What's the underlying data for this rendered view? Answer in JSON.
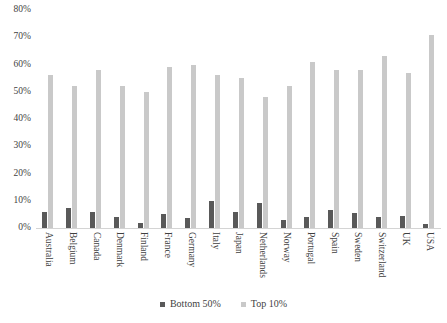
{
  "chart_data": {
    "type": "bar",
    "title": "",
    "xlabel": "",
    "ylabel": "",
    "ylim": [
      0,
      80
    ],
    "grid": false,
    "legend_position": "bottom",
    "y_ticks": [
      "0%",
      "10%",
      "20%",
      "30%",
      "40%",
      "50%",
      "60%",
      "70%",
      "80%"
    ],
    "y_tick_values": [
      0,
      10,
      20,
      30,
      40,
      50,
      60,
      70,
      80
    ],
    "categories": [
      "Australia",
      "Belgium",
      "Canada",
      "Denmark",
      "Finland",
      "France",
      "Germany",
      "Italy",
      "Japan",
      "Netherlands",
      "Norway",
      "Portugal",
      "Spain",
      "Sweden",
      "Switzerland",
      "UK",
      "USA"
    ],
    "series": [
      {
        "name": "Bottom 50%",
        "color": "#595959",
        "values": [
          6,
          7.5,
          6,
          4,
          2,
          5,
          3.5,
          10,
          6,
          9,
          3,
          4,
          6.5,
          5.5,
          4,
          4.5,
          1.5
        ]
      },
      {
        "name": "Top 10%",
        "color": "#c9c9c9",
        "values": [
          56,
          52,
          58,
          52,
          50,
          59,
          60,
          56,
          55,
          48,
          52,
          61,
          58,
          58,
          63,
          57,
          71
        ]
      }
    ]
  },
  "colors": {
    "bottom50": "#595959",
    "top10": "#c9c9c9",
    "axis": "#d4d4d4",
    "text": "#3f3f3f",
    "background": "#ffffff"
  }
}
